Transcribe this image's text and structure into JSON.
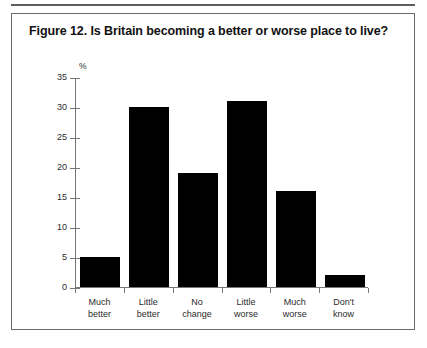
{
  "figure": {
    "title": "Figure 12. Is Britain becoming a better or worse place to live?",
    "axis_unit": "%"
  },
  "chart_data": {
    "type": "bar",
    "title": "Figure 12. Is Britain becoming a better or worse place to live?",
    "xlabel": "",
    "ylabel": "%",
    "ylim": [
      0,
      35
    ],
    "yticks": [
      0,
      5,
      10,
      15,
      20,
      25,
      30,
      35
    ],
    "grid": false,
    "legend": false,
    "bar_color": "#000000",
    "categories": [
      "Much better",
      "Little better",
      "No change",
      "Little worse",
      "Much worse",
      "Don't know"
    ],
    "category_lines": [
      [
        "Much",
        "better"
      ],
      [
        "Little",
        "better"
      ],
      [
        "No",
        "change"
      ],
      [
        "Little",
        "worse"
      ],
      [
        "Much",
        "worse"
      ],
      [
        "Don't",
        "know"
      ]
    ],
    "values": [
      5,
      30,
      19,
      31,
      16,
      2
    ]
  }
}
